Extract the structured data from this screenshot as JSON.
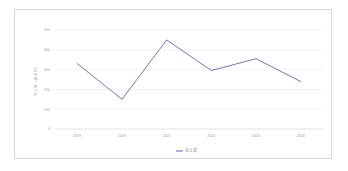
{
  "chart_data": {
    "type": "line",
    "title": "",
    "xlabel": "",
    "ylabel": "売上高（百万円）",
    "categories": [
      "2019",
      "2020",
      "2021",
      "2022",
      "2023",
      "2024"
    ],
    "series": [
      {
        "name": "売上高",
        "values": [
          330,
          150,
          450,
          295,
          355,
          240
        ],
        "color": "#5b6ba8"
      }
    ],
    "ylim": [
      0,
      500
    ],
    "yticks": [
      0,
      100,
      200,
      300,
      400,
      500
    ],
    "ytick_labels": [
      "0",
      "100",
      "200",
      "300",
      "400",
      "500"
    ],
    "grid": true,
    "grid_color": "#e8e8e8",
    "legend_position": "bottom",
    "background_color": "#ffffff",
    "frame_color": "#d9d9d9",
    "tick_label_color": "#9a9a9a"
  },
  "legend": {
    "entries": [
      {
        "label": "売上高",
        "color": "#5b6ba8"
      }
    ]
  }
}
